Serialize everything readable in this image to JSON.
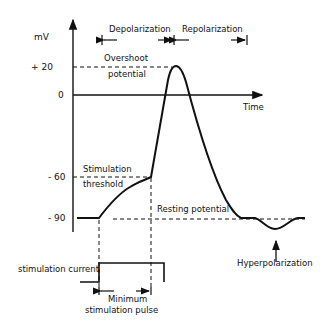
{
  "diagram": {
    "y_unit": "mV",
    "x_label": "Time",
    "y_ticks": [
      {
        "label": "+ 20",
        "value": 20
      },
      {
        "label": "0",
        "value": 0
      },
      {
        "label": "- 60",
        "value": -60
      },
      {
        "label": "- 90",
        "value": -90
      }
    ],
    "phases": {
      "depolarization": "Depolarization",
      "repolarization": "Repolarization"
    },
    "annotations": {
      "overshoot_line1": "Overshoot",
      "overshoot_line2": "potential",
      "threshold_line1": "Stimulation",
      "threshold_line2": "threshold",
      "resting": "Resting potential",
      "hyperpolarization": "Hyperpolarization",
      "stim_current": "stimulation current",
      "min_pulse_line1": "Minimum",
      "min_pulse_line2": "stimulation pulse"
    },
    "colors": {
      "ink": "#111111",
      "background": "#ffffff"
    }
  }
}
